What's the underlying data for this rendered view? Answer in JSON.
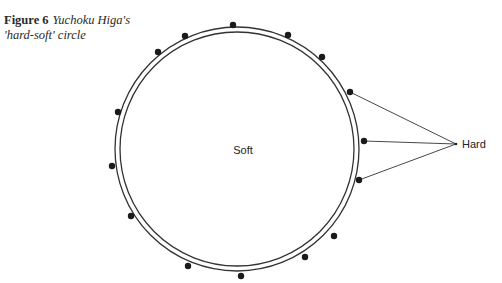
{
  "caption": {
    "figure_label": "Figure 6",
    "title_line1": "Yuchoku Higa's",
    "title_line2": "'hard-soft' circle"
  },
  "diagram": {
    "center_label": "Soft",
    "external_label": "Hard",
    "colors": {
      "stroke": "#333333",
      "dot": "#1a1a1a",
      "text": "#222222"
    },
    "circle": {
      "cx": 237,
      "cy": 149,
      "outer_r": 122,
      "inner_r": 117
    },
    "hard_point": {
      "x": 456,
      "y": 144
    },
    "dots": [
      {
        "x": 233,
        "y": 25
      },
      {
        "x": 185,
        "y": 36
      },
      {
        "x": 288,
        "y": 35
      },
      {
        "x": 158,
        "y": 52
      },
      {
        "x": 322,
        "y": 57
      },
      {
        "x": 350,
        "y": 92,
        "connected": true
      },
      {
        "x": 118,
        "y": 112
      },
      {
        "x": 364,
        "y": 141,
        "connected": true
      },
      {
        "x": 112,
        "y": 166
      },
      {
        "x": 359,
        "y": 180,
        "connected": true
      },
      {
        "x": 131,
        "y": 216
      },
      {
        "x": 334,
        "y": 236
      },
      {
        "x": 305,
        "y": 257
      },
      {
        "x": 188,
        "y": 266
      },
      {
        "x": 241,
        "y": 276
      }
    ]
  }
}
